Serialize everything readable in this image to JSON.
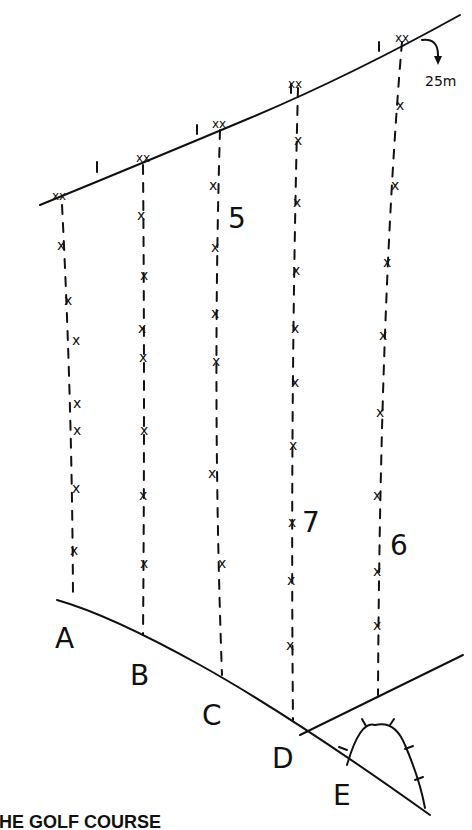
{
  "diagram": {
    "title": "THE GOLF COURSE",
    "caption_visible": "HE GOLF COURSE",
    "scale_annotation": "25m",
    "column_labels": [
      "A",
      "B",
      "C",
      "D",
      "E"
    ],
    "numbers": [
      {
        "text": "5",
        "x": 228,
        "y": 228
      },
      {
        "text": "7",
        "x": 302,
        "y": 532
      },
      {
        "text": "6",
        "x": 390,
        "y": 555
      }
    ],
    "marker_glyph": "x",
    "tee_glyph": "xx",
    "colors": {
      "ink": "#111111",
      "background": "#ffffff"
    }
  }
}
